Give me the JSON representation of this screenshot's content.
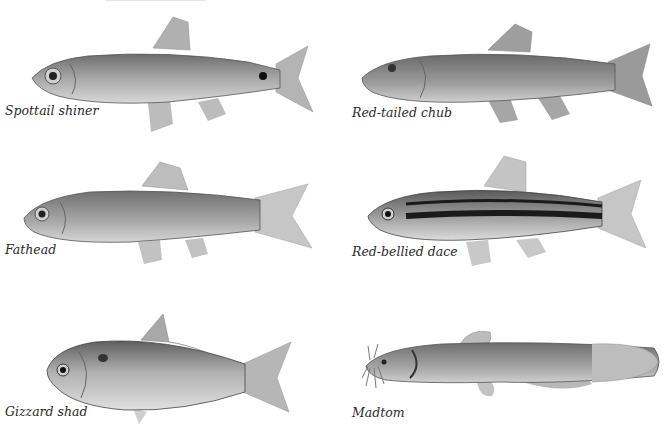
{
  "plate": {
    "fish": [
      {
        "name": "Spottail shiner",
        "position": "top-left"
      },
      {
        "name": "Red-tailed chub",
        "position": "top-right"
      },
      {
        "name": "Fathead",
        "position": "middle-left"
      },
      {
        "name": "Red-bellied dace",
        "position": "middle-right"
      },
      {
        "name": "Gizzard shad",
        "position": "bottom-left"
      },
      {
        "name": "Madtom",
        "position": "bottom-right"
      }
    ]
  }
}
